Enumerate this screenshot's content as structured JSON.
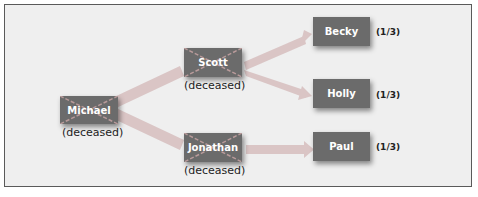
{
  "diagram": {
    "nodes": [
      {
        "id": "michael",
        "label": "Michael",
        "status": "(deceased)",
        "deceased": true
      },
      {
        "id": "scott",
        "label": "Scott",
        "status": "(deceased)",
        "deceased": true
      },
      {
        "id": "jonathan",
        "label": "Jonathan",
        "status": "(deceased)",
        "deceased": true
      },
      {
        "id": "becky",
        "label": "Becky",
        "share": "(1/3)"
      },
      {
        "id": "holly",
        "label": "Holly",
        "share": "(1/3)"
      },
      {
        "id": "paul",
        "label": "Paul",
        "share": "(1/3)"
      }
    ],
    "edges": [
      {
        "from": "michael",
        "to": "scott"
      },
      {
        "from": "michael",
        "to": "jonathan"
      },
      {
        "from": "scott",
        "to": "becky"
      },
      {
        "from": "scott",
        "to": "holly"
      },
      {
        "from": "jonathan",
        "to": "paul"
      }
    ],
    "colors": {
      "node": "#6b6b6b",
      "arrow": "#d4b8b8",
      "background": "#efefef",
      "cross": "#b89a9a"
    }
  }
}
